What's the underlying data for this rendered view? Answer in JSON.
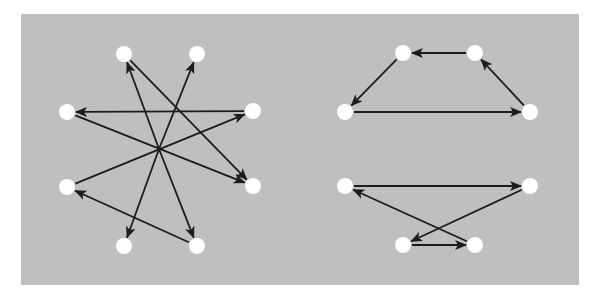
{
  "colors": {
    "background": "#ffffff",
    "panel": "#bfbfbf",
    "node": "#ffffff",
    "edge": "#1c1c1c"
  },
  "node_radius": 8,
  "graphs": [
    {
      "name": "star-graph",
      "center": [
        159,
        149
      ],
      "nodes": [
        {
          "id": "L1",
          "x": 124,
          "y": 54
        },
        {
          "id": "L2",
          "x": 197,
          "y": 54
        },
        {
          "id": "L3",
          "x": 67,
          "y": 112
        },
        {
          "id": "L4",
          "x": 253,
          "y": 111
        },
        {
          "id": "L5",
          "x": 67,
          "y": 187
        },
        {
          "id": "L6",
          "x": 253,
          "y": 186
        },
        {
          "id": "L7",
          "x": 124,
          "y": 246
        },
        {
          "id": "L8",
          "x": 197,
          "y": 246
        }
      ],
      "edges": [
        {
          "from": [
            253,
            111
          ],
          "to": [
            67,
            112
          ]
        },
        {
          "from": [
            67,
            112
          ],
          "to": [
            253,
            186
          ]
        },
        {
          "from": [
            67,
            187
          ],
          "to": [
            253,
            111
          ]
        },
        {
          "from": [
            197,
            246
          ],
          "to": [
            67,
            187
          ]
        },
        {
          "from": [
            124,
            54
          ],
          "to": [
            253,
            186
          ]
        },
        {
          "from": [
            159,
            149
          ],
          "to": [
            124,
            54
          ]
        },
        {
          "from": [
            159,
            149
          ],
          "to": [
            197,
            54
          ]
        },
        {
          "from": [
            159,
            149
          ],
          "to": [
            124,
            246
          ]
        },
        {
          "from": [
            159,
            149
          ],
          "to": [
            197,
            246
          ]
        }
      ]
    },
    {
      "name": "cycle-graph-top",
      "nodes": [
        {
          "id": "A1",
          "x": 345,
          "y": 112
        },
        {
          "id": "A2",
          "x": 403,
          "y": 53
        },
        {
          "id": "A3",
          "x": 475,
          "y": 53
        },
        {
          "id": "A4",
          "x": 530,
          "y": 112
        }
      ],
      "edges": [
        {
          "from": [
            345,
            112
          ],
          "to": [
            530,
            112
          ]
        },
        {
          "from": [
            530,
            112
          ],
          "to": [
            475,
            53
          ]
        },
        {
          "from": [
            475,
            53
          ],
          "to": [
            403,
            53
          ]
        },
        {
          "from": [
            403,
            53
          ],
          "to": [
            345,
            112
          ]
        }
      ]
    },
    {
      "name": "cycle-graph-bottom",
      "nodes": [
        {
          "id": "B1",
          "x": 345,
          "y": 186
        },
        {
          "id": "B2",
          "x": 530,
          "y": 186
        },
        {
          "id": "B3",
          "x": 403,
          "y": 245
        },
        {
          "id": "B4",
          "x": 475,
          "y": 245
        }
      ],
      "edges": [
        {
          "from": [
            345,
            186
          ],
          "to": [
            530,
            186
          ]
        },
        {
          "from": [
            530,
            186
          ],
          "to": [
            403,
            245
          ]
        },
        {
          "from": [
            403,
            245
          ],
          "to": [
            475,
            245
          ]
        },
        {
          "from": [
            475,
            245
          ],
          "to": [
            345,
            186
          ]
        }
      ]
    }
  ]
}
